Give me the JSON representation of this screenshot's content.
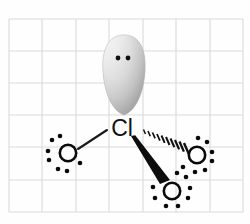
{
  "figure": {
    "background_color": "#fefefe",
    "grid": {
      "visible": true,
      "line_color": "#d9d9d9",
      "x_start": 9,
      "y_start": 19,
      "cell_width": 33.4,
      "cell_height": 32.2,
      "columns": 7,
      "rows": 6
    }
  },
  "molecule": {
    "central_atom": {
      "symbol": "Cl",
      "name": "chlorine",
      "x": 122,
      "y": 127,
      "label_color": "#121212"
    },
    "lone_pair_lobe": {
      "name": "lone-pair-orbital-lobe",
      "shape": "teardrop",
      "center_x": 124,
      "center_y": 74,
      "width": 42,
      "height": 80,
      "fill_light": "#f7f7f7",
      "fill_mid": "#d6d6d6",
      "fill_dark": "#9a9a9a",
      "dots": [
        {
          "x": 118,
          "y": 58,
          "r": 2.4
        },
        {
          "x": 128,
          "y": 58,
          "r": 2.4
        }
      ]
    },
    "oxygens": [
      {
        "id": "oxygen-left",
        "symbol": "O",
        "x": 68,
        "y": 153,
        "radius": 8.2,
        "bond_type": "plain",
        "lone_pair_dots": [
          {
            "x": 52,
            "y": 140
          },
          {
            "x": 59,
            "y": 137
          },
          {
            "x": 48,
            "y": 152
          },
          {
            "x": 49,
            "y": 160
          },
          {
            "x": 58,
            "y": 169
          },
          {
            "x": 66,
            "y": 171
          },
          {
            "x": 80,
            "y": 163
          }
        ]
      },
      {
        "id": "oxygen-right",
        "symbol": "O",
        "x": 197,
        "y": 155,
        "radius": 8.2,
        "bond_type": "hashed",
        "lone_pair_dots": [
          {
            "x": 198,
            "y": 138
          },
          {
            "x": 207,
            "y": 142
          },
          {
            "x": 212,
            "y": 152
          },
          {
            "x": 212,
            "y": 161
          },
          {
            "x": 205,
            "y": 170
          },
          {
            "x": 195,
            "y": 172
          },
          {
            "x": 183,
            "y": 167
          }
        ]
      },
      {
        "id": "oxygen-bottom",
        "symbol": "O",
        "x": 172,
        "y": 191,
        "radius": 8.2,
        "bond_type": "wedge",
        "lone_pair_dots": [
          {
            "x": 176,
            "y": 173
          },
          {
            "x": 186,
            "y": 177
          },
          {
            "x": 190,
            "y": 188
          },
          {
            "x": 188,
            "y": 198
          },
          {
            "x": 178,
            "y": 206
          },
          {
            "x": 166,
            "y": 206
          },
          {
            "x": 155,
            "y": 198
          },
          {
            "x": 153,
            "y": 187
          }
        ]
      }
    ],
    "bonds": [
      {
        "id": "bond-cl-oxygen-left",
        "type": "plain",
        "from_x": 107,
        "from_y": 130,
        "to_x": 78,
        "to_y": 149,
        "color": "#1a1a1a"
      },
      {
        "id": "bond-cl-oxygen-right",
        "type": "hashed",
        "from_x": 141,
        "from_y": 131,
        "to_x": 187,
        "to_y": 150,
        "marks": 11,
        "color": "#111111"
      },
      {
        "id": "bond-cl-oxygen-bottom",
        "type": "wedge-solid",
        "from_x": 132,
        "from_y": 138,
        "to_x": 166,
        "to_y": 181,
        "color": "#0d0d0d"
      }
    ]
  },
  "legend": {
    "formula": "ClO3-",
    "geometry": "trigonal pyramidal",
    "lone_pairs_on_cl": 1
  }
}
